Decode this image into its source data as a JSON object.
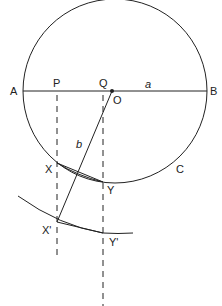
{
  "diagram": {
    "colors": {
      "line": "#222222",
      "background": "#ffffff"
    },
    "labels": {
      "A": "A",
      "B": "B",
      "P": "P",
      "Q": "Q",
      "O": "O",
      "a": "a",
      "b": "b",
      "X": "X",
      "Y": "Y",
      "C": "C",
      "X_prime": "X'",
      "Y_prime": "Y'"
    }
  }
}
